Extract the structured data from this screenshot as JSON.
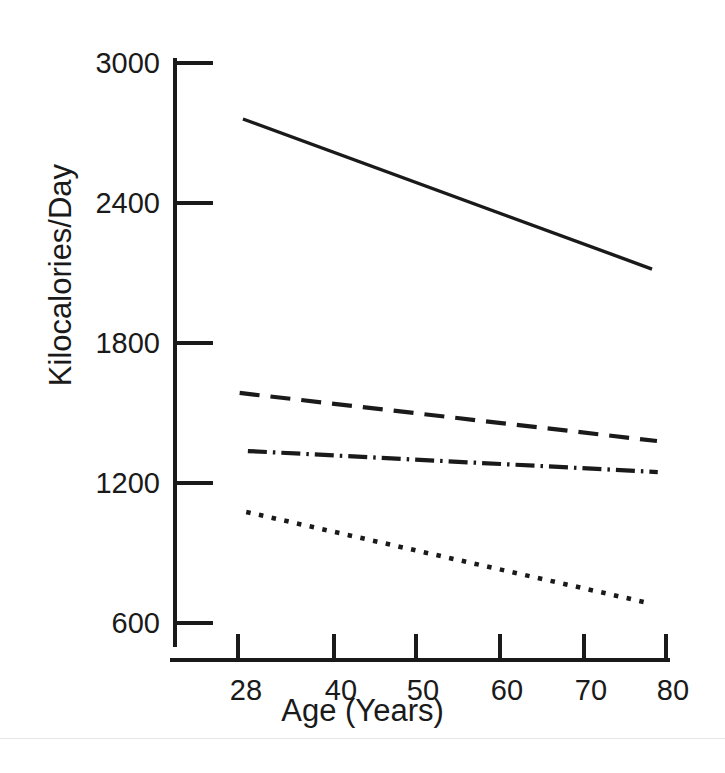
{
  "chart_data": {
    "type": "line",
    "title": "",
    "xlabel": "Age (Years)",
    "ylabel": "Kilocalories/Day",
    "xlim": [
      22,
      80
    ],
    "ylim": [
      600,
      3000
    ],
    "xticks": [
      28,
      40,
      50,
      60,
      70,
      80
    ],
    "xtick_labels": [
      "28",
      "40",
      "50",
      "60",
      "70",
      "80"
    ],
    "yticks": [
      600,
      1200,
      1800,
      2400,
      3000
    ],
    "ytick_labels": [
      "600",
      "1200",
      "1800",
      "2400",
      "3000"
    ],
    "grid": false,
    "legend": "none",
    "series": [
      {
        "name": "solid-line",
        "style": "solid",
        "x": [
          28.6,
          78.3
        ],
        "values": [
          2760,
          2117
        ]
      },
      {
        "name": "dashed-line",
        "style": "dashed",
        "x": [
          28.2,
          78.9
        ],
        "values": [
          1586,
          1380
        ]
      },
      {
        "name": "dash-dot-line",
        "style": "dashdot",
        "x": [
          29.2,
          79.0
        ],
        "values": [
          1337,
          1247
        ]
      },
      {
        "name": "dotted-line",
        "style": "dotted",
        "x": [
          29.0,
          77.8
        ],
        "values": [
          1076,
          686
        ]
      }
    ]
  },
  "axes": {
    "y_title": "Kilocalories/Day",
    "x_title": "Age (Years)",
    "y_tick_labels": [
      "3000",
      "2400",
      "1800",
      "1200",
      "600"
    ],
    "x_tick_labels": [
      "28",
      "40",
      "50",
      "60",
      "70",
      "80"
    ]
  },
  "colors": {
    "ink": "#1a1a1a",
    "background": "#ffffff",
    "rule": "#e6e6e6"
  }
}
